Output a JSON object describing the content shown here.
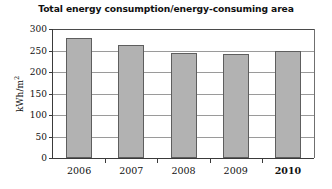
{
  "chart_data": {
    "type": "bar",
    "title": "Total energy consumption/energy-consuming area",
    "xlabel": "",
    "ylabel": "kWh/m",
    "ylabel_superscript": "2",
    "categories": [
      "2006",
      "2007",
      "2008",
      "2009",
      "2010"
    ],
    "values": [
      279,
      262,
      244,
      242,
      248
    ],
    "ylim": [
      0,
      300
    ],
    "ytick_labels": [
      "0",
      "50",
      "100",
      "150",
      "200",
      "250",
      "300"
    ],
    "ytick_values": [
      0,
      50,
      100,
      150,
      200,
      250,
      300
    ],
    "grid": true,
    "legend": "none",
    "emphasized_category": "2010",
    "bar_color": "#b2b2b2",
    "bar_border_color": "#5e5e5e",
    "grid_color": "#9a9a9a",
    "axis_color": "#3a3a3a",
    "background": "#ffffff"
  }
}
